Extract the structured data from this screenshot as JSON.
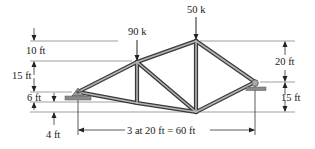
{
  "diagram": {
    "type": "truss",
    "loads": [
      {
        "label": "90 k",
        "node": "B"
      },
      {
        "label": "50 k",
        "node": "C"
      }
    ],
    "dimensions": {
      "left": [
        "10 ft",
        "15 ft",
        "6 ft",
        "4 ft"
      ],
      "right": [
        "20 ft",
        "15 ft"
      ],
      "bottom": "3 at 20 ft = 60 ft"
    },
    "nodes": {
      "A": "left pin support",
      "B": "top chord joint (90 k)",
      "C": "apex (50 k)",
      "D": "right roller support",
      "E": "bottom chord joint below B",
      "F": "bottom chord joint below C"
    },
    "members": [
      "A-B",
      "B-C",
      "C-D",
      "A-E",
      "E-F",
      "F-D",
      "B-E",
      "C-F",
      "B-F"
    ],
    "colors": {
      "member_fill": "#9a9a9a",
      "member_edge": "#3a3a3a",
      "dim_line": "#555555",
      "support": "#8a8a8a"
    }
  }
}
